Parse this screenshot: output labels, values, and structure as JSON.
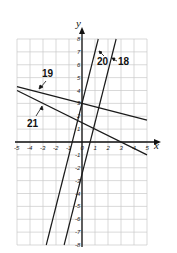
{
  "chart_data": {
    "type": "line",
    "title": "",
    "xlabel": "x",
    "ylabel": "y",
    "xlim": [
      -5,
      5
    ],
    "ylim": [
      -8,
      8
    ],
    "grid": true,
    "x_ticks": [
      "-5",
      "-4",
      "-3",
      "-2",
      "-1",
      "0",
      "1",
      "2",
      "3",
      "4",
      "5"
    ],
    "y_ticks": [
      "8",
      "7",
      "6",
      "5",
      "4",
      "3",
      "2",
      "1",
      "-1",
      "-2",
      "-3",
      "-4",
      "-5",
      "-6",
      "-7",
      "-8"
    ],
    "series": [
      {
        "name": "18",
        "equation": "y = 4x - 2.5",
        "points": [
          [
            -1.375,
            -8
          ],
          [
            2.625,
            8
          ]
        ]
      },
      {
        "name": "19",
        "equation": "y = -0.26x + 3",
        "points": [
          [
            -5,
            4.3
          ],
          [
            5,
            1.7
          ]
        ]
      },
      {
        "name": "20",
        "equation": "y = 4x + 3",
        "points": [
          [
            -2.75,
            -8
          ],
          [
            1.25,
            8
          ]
        ]
      },
      {
        "name": "21",
        "equation": "y = -0.5x + 1.5",
        "points": [
          [
            -5,
            4
          ],
          [
            5,
            -1
          ]
        ]
      }
    ],
    "annotations": [
      {
        "text": "18",
        "target": "line 18"
      },
      {
        "text": "19",
        "target": "line 19"
      },
      {
        "text": "20",
        "target": "line 20"
      },
      {
        "text": "21",
        "target": "line 21"
      }
    ]
  },
  "labels": {
    "x_axis": "x",
    "y_axis": "y",
    "l18": "18",
    "l19": "19",
    "l20": "20",
    "l21": "21"
  }
}
